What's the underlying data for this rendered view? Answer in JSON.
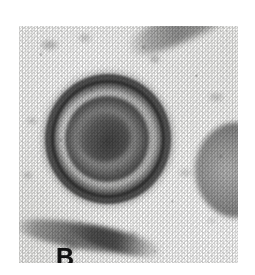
{
  "figure": {
    "panel_label": "B",
    "modality": "transmission electron micrograph",
    "color_mode": "grayscale",
    "page_background": "#ffffff",
    "plate_background": "#f6f6f4",
    "ink_color": "#111111"
  },
  "plate": {
    "left": 19,
    "top": 26,
    "width": 219,
    "height": 237
  },
  "features": {
    "primary_particle": {
      "name": "enveloped virion",
      "description": "roughly circular particle with a dense granular outer envelope, a lucent gap, and an inner nucleocapsid core"
    },
    "secondary_particle": {
      "name": "partial virion",
      "description": "second dark particle clipped by the right edge of the plate"
    },
    "membrane_top": {
      "name": "membrane streak",
      "description": "dark diagonal membrane fragment across the upper right"
    },
    "membrane_bottom": {
      "name": "membrane fragment",
      "description": "dark curved membrane fragment along the lower left"
    },
    "background": {
      "name": "stain background",
      "description": "fine granular halftone background of the printed micrograph"
    }
  }
}
